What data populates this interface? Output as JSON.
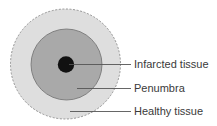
{
  "diagram": {
    "type": "concentric-circles",
    "regions": [
      {
        "name": "Infarcted tissue",
        "fill": "#111111",
        "radius": 8
      },
      {
        "name": "Penumbra",
        "fill": "#a9a9a9",
        "radius": 35.5
      },
      {
        "name": "Healthy tissue",
        "fill": "#dedede",
        "radius": 55,
        "border": "dashed"
      }
    ]
  },
  "labels": {
    "infarcted": "Infarcted tissue",
    "penumbra": "Penumbra",
    "healthy": "Healthy tissue"
  }
}
